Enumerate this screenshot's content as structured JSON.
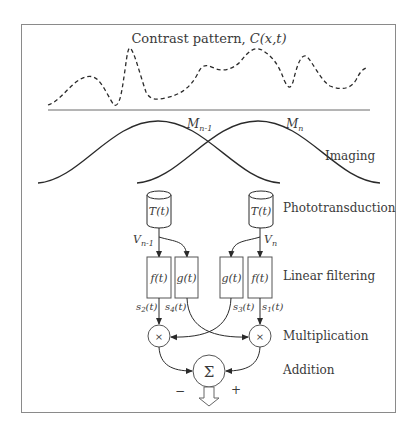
{
  "title": "Contrast pattern, ",
  "title_symbol": "C",
  "title_args": "(x,t)",
  "stage_labels": {
    "imaging": "Imaging",
    "phototransduction": "Phototransduction",
    "linear_filtering": "Linear filtering",
    "multiplication": "Multiplication",
    "addition": "Addition"
  },
  "receptors": {
    "left": {
      "name": "M",
      "subscript": "n-1"
    },
    "right": {
      "name": "M",
      "subscript": "n"
    }
  },
  "transducers": {
    "left": "T(t)",
    "right": "T(t)"
  },
  "voltages": {
    "left": {
      "name": "V",
      "subscript": "n-1"
    },
    "right": {
      "name": "V",
      "subscript": "n"
    }
  },
  "filters": [
    {
      "id": "f-left",
      "label": "f(t)"
    },
    {
      "id": "g-left",
      "label": "g(t)"
    },
    {
      "id": "g-right",
      "label": "g(t)"
    },
    {
      "id": "f-right",
      "label": "f(t)"
    }
  ],
  "signals": {
    "s2": {
      "name": "s",
      "subscript": "2",
      "arg": "(t)"
    },
    "s4": {
      "name": "s",
      "subscript": "4",
      "arg": "(t)"
    },
    "s3": {
      "name": "s",
      "subscript": "3",
      "arg": "(t)"
    },
    "s1": {
      "name": "s",
      "subscript": "1",
      "arg": "(t)"
    }
  },
  "operators": {
    "multiply": "×",
    "sum": "Σ"
  },
  "signs": {
    "minus": "−",
    "plus": "+"
  },
  "colors": {
    "line": "#2a2a2a",
    "frame": "#8a8a8a",
    "text": "#3a3a3a"
  }
}
